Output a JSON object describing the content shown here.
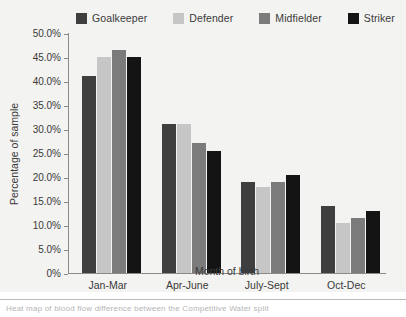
{
  "chart_data": {
    "type": "bar",
    "title": "",
    "xlabel": "Month of birth",
    "ylabel": "Percentage of sample",
    "categories": [
      "Jan-Mar",
      "Apr-June",
      "July-Sept",
      "Oct-Dec"
    ],
    "ylim": [
      0,
      50
    ],
    "ytick_values": [
      50,
      45,
      40,
      35,
      30,
      25,
      20,
      15,
      10,
      5,
      0
    ],
    "ytick_labels": [
      "50.0%",
      "45.0%",
      "40.0%",
      "35.0%",
      "30.0%",
      "25.0%",
      "20.0%",
      "15.0%",
      "10.0%",
      "5.0%",
      "0%"
    ],
    "grid": false,
    "legend_position": "top",
    "series": [
      {
        "name": "Goalkeeper",
        "color": "#3f3f3f",
        "values": [
          41.0,
          31.0,
          19.0,
          14.0
        ]
      },
      {
        "name": "Defender",
        "color": "#c6c6c6",
        "values": [
          45.0,
          31.0,
          18.0,
          10.5
        ]
      },
      {
        "name": "Midfielder",
        "color": "#7b7b7b",
        "values": [
          46.5,
          27.0,
          19.0,
          11.5
        ]
      },
      {
        "name": "Striker",
        "color": "#141414",
        "values": [
          45.0,
          25.5,
          20.5,
          13.0
        ]
      }
    ]
  },
  "axis": {
    "y_title": "Percentage of sample",
    "x_title": "Month of birth"
  },
  "caption": {
    "text": "Heat map of blood flow difference between the Competitive Water split"
  }
}
